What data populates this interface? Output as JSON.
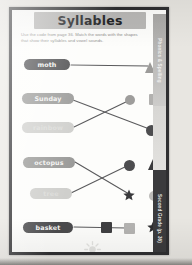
{
  "worksheet": {
    "title": "Syllables",
    "instructions": {
      "line1": "Use the code from page 36. Match the words with the shapes",
      "line2": "that show their syllables and vowel sounds."
    },
    "words": [
      {
        "label": "moth",
        "tone": "dark",
        "x": 12,
        "y": 49,
        "w": 46
      },
      {
        "label": "Sunday",
        "tone": "mid",
        "x": 10,
        "y": 83,
        "w": 52
      },
      {
        "label": "rainbow",
        "tone": "faint",
        "x": 10,
        "y": 112,
        "w": 52
      },
      {
        "label": "octopus",
        "tone": "mid",
        "x": 11,
        "y": 147,
        "w": 52
      },
      {
        "label": "tree",
        "tone": "faint",
        "x": 18,
        "y": 178,
        "w": 42
      },
      {
        "label": "basket",
        "tone": "dark",
        "x": 11,
        "y": 212,
        "w": 50
      }
    ],
    "shapes": [
      {
        "name": "triangle",
        "kind": "tri",
        "color": "#9c9b99",
        "size": 11,
        "x": 133,
        "y": 52
      },
      {
        "name": "circle",
        "kind": "circle",
        "color": "#9e9d9b",
        "size": 10,
        "x": 113,
        "y": 85
      },
      {
        "name": "square",
        "kind": "square",
        "color": "#b2b1af",
        "size": 11,
        "x": 137,
        "y": 84
      },
      {
        "name": "circle",
        "kind": "circle",
        "color": "#4d4d4f",
        "size": 11,
        "x": 134,
        "y": 115
      },
      {
        "name": "circle",
        "kind": "circle",
        "color": "#4d4d4f",
        "size": 11,
        "x": 112,
        "y": 150
      },
      {
        "name": "triangle",
        "kind": "tri",
        "color": "#3a3a3c",
        "size": 11,
        "x": 136,
        "y": 149
      },
      {
        "name": "star",
        "kind": "star",
        "color": "#3a3a3c",
        "size": 12,
        "x": 111,
        "y": 179
      },
      {
        "name": "circle",
        "kind": "circle",
        "color": "#bbbab8",
        "size": 10,
        "x": 137,
        "y": 181
      },
      {
        "name": "square",
        "kind": "square",
        "color": "#3f3f41",
        "size": 11,
        "x": 89,
        "y": 212
      },
      {
        "name": "square",
        "kind": "square",
        "color": "#b4b3b1",
        "size": 11,
        "x": 112,
        "y": 213
      },
      {
        "name": "star",
        "kind": "star",
        "color": "#2f2f31",
        "size": 12,
        "x": 135,
        "y": 211
      }
    ],
    "connections": [
      {
        "from_word": "moth",
        "to_shape": "triangle",
        "x1": 59,
        "y1": 55,
        "x2": 136,
        "y2": 56
      },
      {
        "from_word": "Sunday",
        "to_shape": "circle",
        "x1": 61,
        "y1": 90,
        "x2": 140,
        "y2": 120
      },
      {
        "from_word": "rainbow",
        "to_shape": "circle",
        "x1": 62,
        "y1": 117,
        "x2": 118,
        "y2": 90
      },
      {
        "from_word": "octopus",
        "to_shape": "star",
        "x1": 63,
        "y1": 152,
        "x2": 117,
        "y2": 184
      },
      {
        "from_word": "tree",
        "to_shape": "circle",
        "x1": 59,
        "y1": 183,
        "x2": 117,
        "y2": 155
      },
      {
        "from_word": "basket",
        "to_shape": "square",
        "x1": 62,
        "y1": 217,
        "x2": 114,
        "y2": 218
      }
    ],
    "line_color": "#5a5a5c"
  },
  "side_tabs": {
    "top": "Phonics & Spelling",
    "bottom": "Second Grade (p. 36)"
  }
}
